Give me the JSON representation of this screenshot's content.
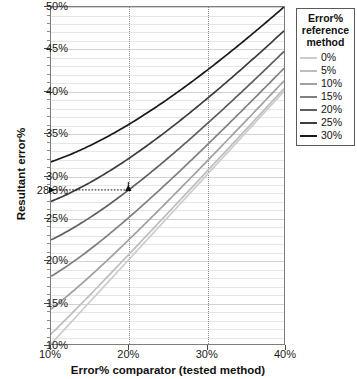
{
  "chart_data": {
    "type": "line",
    "title": "",
    "xlabel": "Error% comparator (tested method)",
    "ylabel": "Resultant error%",
    "xlim": [
      10,
      40
    ],
    "ylim": [
      10,
      50
    ],
    "xticks": [
      "10%",
      "20%",
      "30%",
      "40%"
    ],
    "xtick_values": [
      10,
      20,
      30,
      40
    ],
    "yticks": [
      "10%",
      "15%",
      "20%",
      "25%",
      "30%",
      "35%",
      "40%",
      "45%",
      "50%"
    ],
    "ytick_values": [
      10,
      15,
      20,
      25,
      30,
      35,
      40,
      45,
      50
    ],
    "grid": true,
    "grid_minor_step": 1,
    "legend_position": "top-right",
    "legend_title": "Error% reference method",
    "x": [
      10,
      15,
      20,
      25,
      30,
      35,
      40
    ],
    "series": [
      {
        "name": "0%",
        "color": "#cccccc",
        "values": [
          10.0,
          15.0,
          20.0,
          25.0,
          30.0,
          35.0,
          40.0
        ]
      },
      {
        "name": "5%",
        "color": "#bdbdbd",
        "values": [
          11.2,
          15.8,
          20.6,
          25.5,
          30.4,
          35.4,
          40.3
        ]
      },
      {
        "name": "10%",
        "color": "#a0a0a0",
        "values": [
          14.1,
          18.0,
          22.4,
          26.9,
          31.6,
          36.4,
          41.2
        ]
      },
      {
        "name": "15%",
        "color": "#808080",
        "values": [
          18.0,
          21.2,
          25.0,
          29.2,
          33.5,
          38.1,
          42.7
        ]
      },
      {
        "name": "20%",
        "color": "#5e5e5e",
        "values": [
          22.4,
          25.0,
          28.3,
          32.0,
          36.1,
          40.3,
          44.7
        ]
      },
      {
        "name": "25%",
        "color": "#3d3d3d",
        "values": [
          26.9,
          29.2,
          32.0,
          35.4,
          39.1,
          43.0,
          47.2
        ]
      },
      {
        "name": "30%",
        "color": "#1a1a1a",
        "values": [
          31.6,
          33.5,
          36.1,
          39.1,
          42.4,
          46.1,
          50.0
        ]
      }
    ],
    "annotation": {
      "label": "28.3%",
      "x": 20,
      "y": 28.3,
      "style": "dotted-arrow-to-y-axis"
    }
  },
  "legend": {
    "title_lines": [
      "Error%",
      "reference",
      "method"
    ],
    "items": [
      {
        "label": "0%"
      },
      {
        "label": "5%"
      },
      {
        "label": "10%"
      },
      {
        "label": "15%"
      },
      {
        "label": "20%"
      },
      {
        "label": "25%"
      },
      {
        "label": "30%"
      }
    ]
  },
  "axes": {
    "x_title": "Error% comparator (tested method)",
    "y_title": "Resultant error%",
    "y_special_label": "28.3%"
  }
}
